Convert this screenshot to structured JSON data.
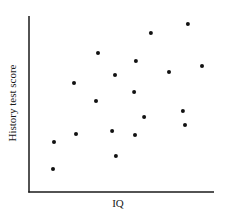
{
  "chart_data": {
    "type": "scatter",
    "title": "",
    "xlabel": "IQ",
    "ylabel": "History test score",
    "xlim": [
      0,
      100
    ],
    "ylim": [
      0,
      100
    ],
    "x_ticks": [],
    "y_ticks": [],
    "grid": false,
    "legend": null,
    "units_note": "No tick marks or numeric scale shown; coordinates are relative positions (0-100) within plot area",
    "points": [
      {
        "x": 13.0,
        "y": 13.1
      },
      {
        "x": 13.5,
        "y": 28.4
      },
      {
        "x": 24.3,
        "y": 61.9
      },
      {
        "x": 25.4,
        "y": 33.0
      },
      {
        "x": 36.2,
        "y": 51.7
      },
      {
        "x": 37.3,
        "y": 79.0
      },
      {
        "x": 44.9,
        "y": 34.7
      },
      {
        "x": 46.5,
        "y": 66.5
      },
      {
        "x": 47.0,
        "y": 20.5
      },
      {
        "x": 56.8,
        "y": 56.8
      },
      {
        "x": 57.3,
        "y": 32.4
      },
      {
        "x": 57.8,
        "y": 74.4
      },
      {
        "x": 62.2,
        "y": 42.6
      },
      {
        "x": 65.9,
        "y": 90.3
      },
      {
        "x": 75.7,
        "y": 68.2
      },
      {
        "x": 83.2,
        "y": 46.0
      },
      {
        "x": 84.3,
        "y": 38.1
      },
      {
        "x": 85.9,
        "y": 95.5
      },
      {
        "x": 93.5,
        "y": 71.6
      }
    ]
  },
  "style": {
    "axis_color": "#1a1a1a",
    "dot_color": "#111111",
    "background": "#ffffff"
  }
}
